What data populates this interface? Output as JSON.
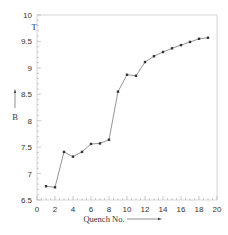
{
  "chart_data": {
    "type": "line",
    "title": "",
    "xlabel": "Quench No.",
    "ylabel": "B",
    "yunit": "T",
    "xlim": [
      0,
      20
    ],
    "ylim": [
      6.5,
      10
    ],
    "xticks": [
      0,
      2,
      4,
      6,
      8,
      10,
      12,
      14,
      16,
      18,
      20
    ],
    "yticks": [
      6.5,
      7,
      7.5,
      8,
      8.5,
      9,
      9.5,
      10
    ],
    "xtick_labels": [
      "0",
      "2",
      "4",
      "6",
      "8",
      "10",
      "12",
      "14",
      "16",
      "18",
      "20"
    ],
    "ytick_labels": [
      "6.5",
      "7",
      "7.5",
      "8",
      "8.5",
      "9",
      "9.5",
      "10"
    ],
    "grid": false,
    "legend": null,
    "series": [
      {
        "name": "B",
        "marker": "square",
        "color": "#444444",
        "x": [
          1,
          2,
          3,
          4,
          5,
          6,
          7,
          8,
          9,
          10,
          11,
          12,
          13,
          14,
          15,
          16,
          17,
          18,
          19
        ],
        "values": [
          6.76,
          6.74,
          7.41,
          7.32,
          7.41,
          7.56,
          7.57,
          7.64,
          8.55,
          8.87,
          8.85,
          9.11,
          9.22,
          9.3,
          9.37,
          9.43,
          9.49,
          9.55,
          9.57
        ]
      }
    ]
  },
  "labels": {
    "x_axis": "Quench No.",
    "y_axis": "B",
    "y_unit": "T"
  },
  "colors": {
    "axis": "#cccccc",
    "line": "#666666",
    "marker": "#333333",
    "text": "#333333"
  }
}
